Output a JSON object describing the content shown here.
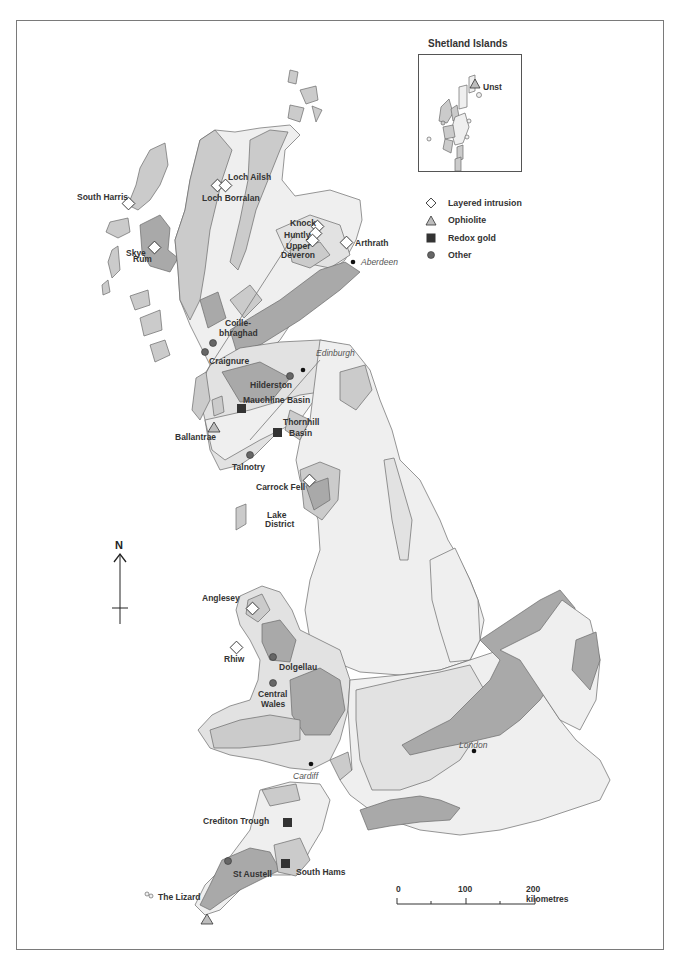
{
  "map": {
    "title": "Mineral deposit sites of Great Britain",
    "colors": {
      "land_light": "#efefef",
      "land_pale": "#e2e2e2",
      "land_mid": "#cbcbcb",
      "land_dark": "#a9a9a9",
      "outline": "#6a6a6a",
      "marker_dark": "#333333",
      "marker_other": "#666666"
    }
  },
  "inset": {
    "title": "Shetland Islands",
    "label": "Unst"
  },
  "legend": {
    "items": [
      {
        "symbol": "diamond-open",
        "label": "Layered intrusion"
      },
      {
        "symbol": "triangle-grey",
        "label": "Ophiolite"
      },
      {
        "symbol": "square-dark",
        "label": "Redox gold"
      },
      {
        "symbol": "circle-dark",
        "label": "Other"
      }
    ]
  },
  "sites": {
    "layered_intrusion": [
      "Loch Ailsh",
      "Loch Borralan",
      "South Harris",
      "Rum",
      "Knock",
      "Huntly",
      "Upper Deveron",
      "Arthrath",
      "Carrock Fell",
      "Anglesey",
      "Rhiw"
    ],
    "ophiolite": [
      "Unst",
      "Ballantrae",
      "The Lizard"
    ],
    "redox_gold": [
      "Mauchline Basin",
      "Thornhill Basin",
      "Crediton Trough",
      "South Hams"
    ],
    "other": [
      "Coille-bhraghad",
      "Craignure",
      "Hilderston",
      "Talnotry",
      "Dolgellau",
      "Central Wales",
      "St Austell"
    ]
  },
  "labels": {
    "loch_ailsh": "Loch Ailsh",
    "loch_borralan": "Loch Borralan",
    "south_harris": "South Harris",
    "skye": "Skye",
    "rum": "Rum",
    "knock": "Knock",
    "huntly": "Huntly",
    "upper": "Upper",
    "deveron": "Deveron",
    "arthrath": "Arthrath",
    "coille": "Coille-",
    "bhraghad": "bhraghad",
    "craignure": "Craignure",
    "hilderston": "Hilderston",
    "mauchline": "Mauchline Basin",
    "thornhill": "Thornhill",
    "basin": "Basin",
    "ballantrae": "Ballantrae",
    "talnotry": "Talnotry",
    "carrock": "Carrock Fell",
    "lake": "Lake",
    "district": "District",
    "anglesey": "Anglesey",
    "rhiw": "Rhiw",
    "dolgellau": "Dolgellau",
    "central": "Central",
    "wales": "Wales",
    "crediton": "Crediton Trough",
    "st_austell": "St Austell",
    "south_hams": "South Hams",
    "lizard": "The Lizard"
  },
  "cities": {
    "aberdeen": "Aberdeen",
    "edinburgh": "Edinburgh",
    "cardiff": "Cardiff",
    "london": "London"
  },
  "north_arrow": {
    "label": "N"
  },
  "scale_bar": {
    "ticks": [
      "0",
      "100",
      "200 kilometres"
    ]
  }
}
